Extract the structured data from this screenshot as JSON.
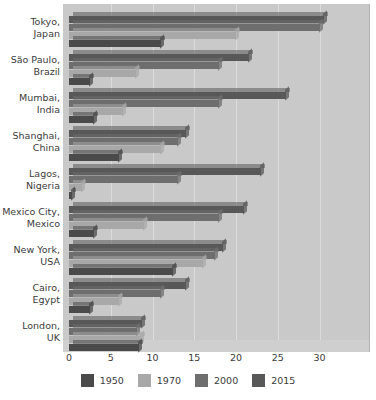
{
  "chart_data": {
    "type": "bar",
    "orientation": "horizontal",
    "title": "",
    "subtitle": "",
    "xlabel": "",
    "ylabel": "",
    "xlim": [
      0,
      30
    ],
    "xticks": [
      0,
      5,
      10,
      15,
      20,
      25,
      30
    ],
    "xtick_labels": [
      "0",
      "5",
      "10",
      "15",
      "20",
      "25",
      "30"
    ],
    "grid": true,
    "grid_axis": "x",
    "legend_position": "bottom",
    "style": "3d-grayscale",
    "categories": [
      "Tokyo,\nJapan",
      "São Paulo,\nBrazil",
      "Mumbai,\nIndia",
      "Shanghai,\nChina",
      "Lagos,\nNigeria",
      "Mexico City,\nMexico",
      "New York,\nUSA",
      "Cairo,\nEgypt",
      "London,\nUK"
    ],
    "category_labels": [
      [
        "Tokyo,",
        "Japan"
      ],
      [
        "São Paulo,",
        "Brazil"
      ],
      [
        "Mumbai,",
        "India"
      ],
      [
        "Shanghai,",
        "China"
      ],
      [
        "Lagos,",
        "Nigeria"
      ],
      [
        "Mexico City,",
        "Mexico"
      ],
      [
        "New York,",
        "USA"
      ],
      [
        "Cairo,",
        "Egypt"
      ],
      [
        "London,",
        "UK"
      ]
    ],
    "series": [
      {
        "name": "1950",
        "color": "#4a4a4a",
        "values": [
          11.0,
          2.5,
          3.0,
          6.0,
          0.3,
          3.0,
          12.5,
          2.5,
          8.4
        ]
      },
      {
        "name": "1970",
        "color": "#a8a8a8",
        "values": [
          20.0,
          8.0,
          6.5,
          11.0,
          1.5,
          9.0,
          16.0,
          6.0,
          8.6
        ]
      },
      {
        "name": "2000",
        "color": "#6e6e6e",
        "values": [
          30.0,
          18.0,
          18.0,
          13.0,
          13.0,
          18.0,
          17.5,
          11.0,
          8.2
        ]
      },
      {
        "name": "2015",
        "color": "#585858",
        "values": [
          30.5,
          21.5,
          26.0,
          14.0,
          23.0,
          21.0,
          18.5,
          14.0,
          8.8
        ]
      }
    ],
    "series_draw_order": [
      "2015",
      "2000",
      "1970",
      "1950"
    ],
    "legend": [
      {
        "label": "1950",
        "color": "#4a4a4a"
      },
      {
        "label": "1970",
        "color": "#a8a8a8"
      },
      {
        "label": "2000",
        "color": "#6e6e6e"
      },
      {
        "label": "2015",
        "color": "#585858"
      }
    ],
    "colors": {
      "plot_background": "#c9c9c9",
      "page_background": "#ffffff",
      "grid": "#dcdcdc",
      "text": "#3b3b3b"
    }
  }
}
